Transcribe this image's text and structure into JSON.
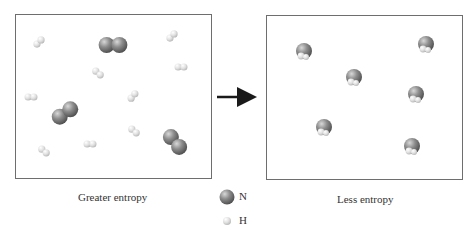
{
  "diagram": {
    "left_panel": {
      "caption": "Greater entropy",
      "description": "3 N2 molecules and 9 H2 molecules scattered randomly",
      "n2_molecules": [
        {
          "x": 113,
          "y": 45,
          "angle": 0
        },
        {
          "x": 65,
          "y": 113,
          "angle": -35
        },
        {
          "x": 175,
          "y": 142,
          "angle": 50
        }
      ],
      "h2_molecules": [
        {
          "x": 39,
          "y": 42,
          "angle": -45
        },
        {
          "x": 172,
          "y": 36,
          "angle": -45
        },
        {
          "x": 98,
          "y": 73,
          "angle": 40
        },
        {
          "x": 181,
          "y": 67,
          "angle": 0
        },
        {
          "x": 31,
          "y": 97,
          "angle": 0
        },
        {
          "x": 133,
          "y": 96,
          "angle": -50
        },
        {
          "x": 134,
          "y": 131,
          "angle": 40
        },
        {
          "x": 90,
          "y": 144,
          "angle": 0
        },
        {
          "x": 44,
          "y": 151,
          "angle": 40
        }
      ]
    },
    "arrow": {
      "from_x": 217,
      "to_x": 258,
      "y": 97
    },
    "right_panel": {
      "caption": "Less entropy",
      "description": "6 NH3 molecules",
      "nh3_molecules": [
        {
          "x": 304,
          "y": 51
        },
        {
          "x": 426,
          "y": 44
        },
        {
          "x": 354,
          "y": 77
        },
        {
          "x": 416,
          "y": 94
        },
        {
          "x": 324,
          "y": 127
        },
        {
          "x": 412,
          "y": 146
        }
      ]
    },
    "legend": [
      {
        "symbol": "N",
        "color": "#7a7a7a",
        "size": "large"
      },
      {
        "symbol": "H",
        "color": "#d6d6d6",
        "size": "small"
      }
    ]
  },
  "colors": {
    "nitrogen_light": "#c4c4c4",
    "nitrogen_dark": "#5a5a5a",
    "hydrogen_light": "#f2f2f2",
    "hydrogen_dark": "#b9b9b9",
    "border": "#6e6e6e",
    "arrow": "#1a1a1a"
  }
}
